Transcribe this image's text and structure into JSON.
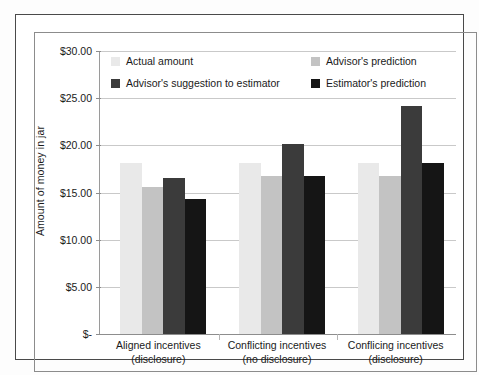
{
  "figure": {
    "y_axis_title": "Amount of money in jar",
    "y_tick_labels": [
      "$30.00",
      "$25.00",
      "$20.00",
      "$15.00",
      "$10.00",
      "$5.00",
      "$-"
    ],
    "legend": [
      {
        "label": "Actual amount",
        "color": "#e9e9e9"
      },
      {
        "label": "Advisor's prediction",
        "color": "#c3c3c3"
      },
      {
        "label": "Advisor's suggestion to estimator",
        "color": "#3b3b3b"
      },
      {
        "label": "Estimator's prediction",
        "color": "#151515"
      }
    ],
    "x_labels": [
      {
        "line1": "Aligned incentives",
        "line2": "(disclosure)"
      },
      {
        "line1": "Conflicting incentives",
        "line2": "(no disclosure)"
      },
      {
        "line1": "Conflicing incentives",
        "line2": "(disclosure)"
      }
    ]
  },
  "chart_data": {
    "type": "bar",
    "title": "",
    "xlabel": "",
    "ylabel": "Amount of money in jar",
    "ylim": [
      0,
      30
    ],
    "ytick_values": [
      30,
      25,
      20,
      15,
      10,
      5,
      0
    ],
    "ytick_labels": [
      "$30.00",
      "$25.00",
      "$20.00",
      "$15.00",
      "$10.00",
      "$5.00",
      "$-"
    ],
    "grid": true,
    "legend_position": "upper-center-inside",
    "categories": [
      "Aligned incentives (disclosure)",
      "Conflicting incentives (no disclosure)",
      "Conflicing incentives (disclosure)"
    ],
    "series": [
      {
        "name": "Actual amount",
        "color": "#e9e9e9",
        "values": [
          18.1,
          18.1,
          18.1
        ]
      },
      {
        "name": "Advisor's prediction",
        "color": "#c3c3c3",
        "values": [
          15.6,
          16.7,
          16.8
        ]
      },
      {
        "name": "Advisor's suggestion to estimator",
        "color": "#3b3b3b",
        "values": [
          16.5,
          20.1,
          24.2
        ]
      },
      {
        "name": "Estimator's prediction",
        "color": "#151515",
        "values": [
          14.3,
          16.8,
          18.1
        ]
      }
    ]
  }
}
